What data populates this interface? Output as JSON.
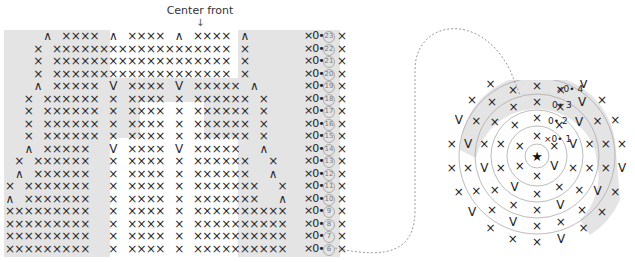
{
  "header": {
    "center_label": "Center front",
    "center_arrow": "↓"
  },
  "colors": {
    "shade": "#e4e4e4",
    "stitch": "#2a2a2a",
    "ring": "#aaaaaa",
    "dashed_path": "#999999"
  },
  "legend": {
    "sc": "×",
    "inc": "V",
    "dec": "∧",
    "ch": "0",
    "sl_st": "•",
    "start": "★"
  },
  "flat_chart": {
    "row_end": "×0•",
    "rows": [
      {
        "num": "23",
        "stitches": "    ^ xxxx ^ xxxx ^ xxxx ^      "
      },
      {
        "num": "22",
        "stitches": "   x xxxxxxxxxxxxxxxxxxx x      "
      },
      {
        "num": "21",
        "stitches": "   x xxxxxxxxxxxxxxxxxxx x      "
      },
      {
        "num": "20",
        "stitches": "   x xxxxxxxxxxxxxxxxxxx x      "
      },
      {
        "num": "19",
        "stitches": "   ^ xxxxx V xxxx V xxxxx ^     "
      },
      {
        "num": "18",
        "stitches": "  x xxxxxx x xxxx x xxxxxx x    "
      },
      {
        "num": "17",
        "stitches": "  x xxxxxx x xxxx x xxxxxx x    "
      },
      {
        "num": "16",
        "stitches": "  x xxxxxx x xxxx x xxxxxx x    "
      },
      {
        "num": "15",
        "stitches": "  x xxxxxx x xxxx x xxxxxx x    "
      },
      {
        "num": "14",
        "stitches": "  ^ xxxxx  V xxxx V xxxxx  ^    "
      },
      {
        "num": "13",
        "stitches": " x xxxxxx  x xxxx x xxxxxx  x   "
      },
      {
        "num": "12",
        "stitches": " ^ xxxxxx  x xxxx x xxxxxx  ^   "
      },
      {
        "num": "11",
        "stitches": "x xxxxxxx  x xxxx x xxxxxxx  x  "
      },
      {
        "num": "10",
        "stitches": "^ xxxxxxx  x xxxx x xxxxxxx  ^  "
      },
      {
        "num": "9",
        "stitches": "xxxxxxxxx  x xxxx x xxxxxxxxxx  "
      },
      {
        "num": "8",
        "stitches": "xxxxxxxxx  x xxxx x xxxxxxxxxx  "
      },
      {
        "num": "7",
        "stitches": "xxxxxxxxx  x xxxx x xxxxxxxxxx  "
      },
      {
        "num": "6",
        "stitches": "xxxxxxxxx  x xxxx x xxxxxxxxxx  "
      }
    ]
  },
  "round_chart": {
    "center_symbol": "★",
    "rounds": [
      {
        "num": "1",
        "end": "×0•"
      },
      {
        "num": "2",
        "end": "0•"
      },
      {
        "num": "3",
        "end": "0•"
      },
      {
        "num": "4",
        "end": "×0•"
      },
      {
        "num": "5",
        "end": "0•"
      }
    ]
  }
}
